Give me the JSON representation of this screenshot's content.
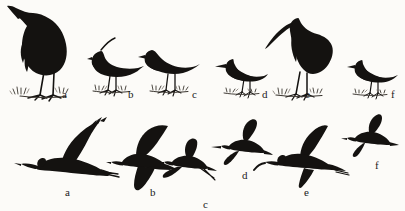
{
  "plate": {
    "title": "Wader silhouette identification plate",
    "background_color": "#fcfbf8",
    "ink_color": "#141210",
    "width": 405,
    "height": 211
  },
  "rows": [
    {
      "id": "standing",
      "name": "standing-birds-row",
      "caption": "Standing silhouettes"
    },
    {
      "id": "flying",
      "name": "flying-birds-row",
      "caption": "Flight silhouettes"
    }
  ],
  "standing": [
    {
      "letter": "a",
      "name": "heron",
      "posture": "standing",
      "bill": "long dagger",
      "size": "large"
    },
    {
      "letter": "b",
      "name": "lapwing",
      "posture": "standing",
      "bill": "short",
      "size": "small",
      "feature": "crest"
    },
    {
      "letter": "c",
      "name": "sandpiper",
      "posture": "standing",
      "bill": "short",
      "size": "small"
    },
    {
      "letter": "d",
      "name": "snipe",
      "posture": "standing",
      "bill": "long straight",
      "size": "small"
    },
    {
      "letter": "e",
      "name": "curlew",
      "posture": "standing",
      "bill": "long downcurved",
      "size": "large"
    },
    {
      "letter": "f",
      "name": "redshank",
      "posture": "standing",
      "bill": "medium straight",
      "size": "small"
    }
  ],
  "flying": [
    {
      "letter": "a",
      "name": "heron",
      "posture": "flying",
      "wings": "raised arched",
      "neck": "hunched"
    },
    {
      "letter": "b",
      "name": "lapwing",
      "posture": "flying",
      "wings": "broad rounded"
    },
    {
      "letter": "c",
      "name": "sandpiper",
      "posture": "flying",
      "wings": "swept back",
      "feature": "trailing legs"
    },
    {
      "letter": "d",
      "name": "snipe",
      "posture": "flying",
      "wings": "pointed",
      "bill": "long straight"
    },
    {
      "letter": "e",
      "name": "curlew",
      "posture": "flying",
      "wings": "long angled",
      "bill": "long downcurved"
    },
    {
      "letter": "f",
      "name": "redshank",
      "posture": "flying",
      "wings": "pointed swept"
    }
  ]
}
